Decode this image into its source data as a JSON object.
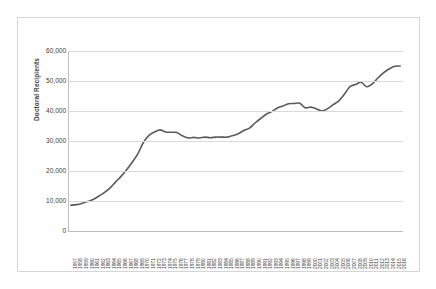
{
  "chart_data": {
    "type": "line",
    "title": "",
    "xlabel": "",
    "ylabel": "Doctoral Recipients",
    "ylim": [
      0,
      60000
    ],
    "yticks": [
      0,
      10000,
      20000,
      30000,
      40000,
      50000,
      60000
    ],
    "ytick_labels": [
      "0",
      "10,000",
      "20,000",
      "30,000",
      "40,000",
      "50,000",
      "60,000"
    ],
    "grid": true,
    "legend": "none",
    "line_color": "#5a5a5a",
    "categories": [
      "1957",
      "1958",
      "1959",
      "1960",
      "1961",
      "1962",
      "1963",
      "1964",
      "1965",
      "1966",
      "1967",
      "1968",
      "1969",
      "1970",
      "1971",
      "1972",
      "1973",
      "1974",
      "1975",
      "1976",
      "1977",
      "1978",
      "1979",
      "1980",
      "1981",
      "1982",
      "1983",
      "1984",
      "1985",
      "1986",
      "1987",
      "1988",
      "1989",
      "1990",
      "1991",
      "1992",
      "1993",
      "1994",
      "1995",
      "1996",
      "1997",
      "1998",
      "1999",
      "2000",
      "2001",
      "2002",
      "2003",
      "2004",
      "2005",
      "2006",
      "2007",
      "2008",
      "2009",
      "2010",
      "2011",
      "2012",
      "2013",
      "2014",
      "2015",
      "2016"
    ],
    "values": [
      8600,
      8800,
      9200,
      9800,
      10500,
      11600,
      12800,
      14300,
      16300,
      18200,
      20400,
      22900,
      25700,
      29500,
      31900,
      33000,
      33700,
      33000,
      32900,
      32800,
      31700,
      31000,
      31200,
      31000,
      31300,
      31100,
      31300,
      31300,
      31300,
      31800,
      32400,
      33500,
      34300,
      36000,
      37500,
      38900,
      39800,
      41000,
      41700,
      42400,
      42500,
      42600,
      41100,
      41300,
      40700,
      40000,
      40800,
      42100,
      43400,
      45600,
      48100,
      48800,
      49600,
      48100,
      49000,
      51000,
      52700,
      54000,
      54900,
      55000
    ]
  }
}
